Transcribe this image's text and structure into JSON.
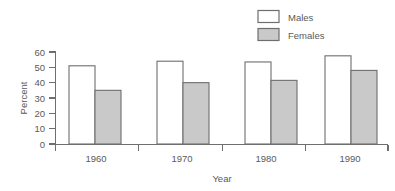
{
  "chart_data": {
    "type": "bar",
    "title": "",
    "subtitle": "",
    "xlabel": "Year",
    "ylabel": "Percent",
    "categories": [
      "1960",
      "1970",
      "1980",
      "1990"
    ],
    "series": [
      {
        "name": "Males",
        "values": [
          51,
          54,
          53.5,
          57.5
        ],
        "color": "#ffffff"
      },
      {
        "name": "Females",
        "values": [
          35,
          40,
          41.5,
          48
        ],
        "color": "#c9c9c9"
      }
    ],
    "ylim": [
      0,
      60
    ],
    "yticks": [
      "0",
      "10",
      "20",
      "30",
      "40",
      "50",
      "60"
    ],
    "grid": false,
    "legend_position": "top-right",
    "border_color": "#6e6e6e",
    "text_color": "#5a5a5a",
    "background": "#ffffff"
  },
  "legend": {
    "entries": [
      {
        "label": "Males"
      },
      {
        "label": "Females"
      }
    ]
  },
  "axes": {
    "y_title": "Percent",
    "x_title": "Year"
  }
}
